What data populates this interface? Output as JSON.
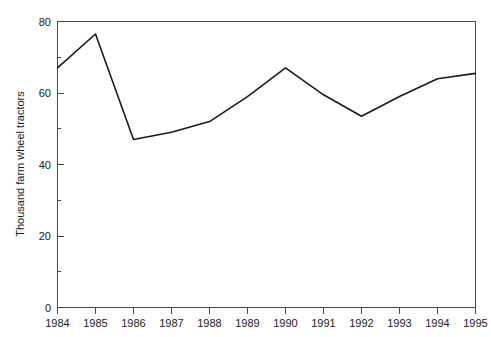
{
  "chart_data": {
    "type": "line",
    "title": "",
    "subtitle": "",
    "xlabel": "",
    "ylabel": "Thousand farm wheel tractors",
    "categories": [
      "1984",
      "1985",
      "1986",
      "1987",
      "1988",
      "1989",
      "1990",
      "1991",
      "1992",
      "1993",
      "1994",
      "1995"
    ],
    "x": [
      1984,
      1985,
      1986,
      1987,
      1988,
      1989,
      1990,
      1991,
      1992,
      1993,
      1994,
      1995
    ],
    "values": [
      67,
      76.5,
      47,
      49,
      52,
      59,
      67,
      59.5,
      53.5,
      59,
      64,
      65.5
    ],
    "series": [
      {
        "name": "Thousand farm wheel tractors",
        "values": [
          67,
          76.5,
          47,
          49,
          52,
          59,
          67,
          59.5,
          53.5,
          59,
          64,
          65.5
        ]
      }
    ],
    "ylim": [
      0,
      80
    ],
    "yticks": [
      0,
      20,
      40,
      60,
      80
    ],
    "ytick_labels": [
      "0",
      "20",
      "40",
      "60",
      "80"
    ],
    "yminor_ticks": [
      10,
      30,
      50,
      70
    ],
    "xticks": [
      1984,
      1985,
      1986,
      1987,
      1988,
      1989,
      1990,
      1991,
      1992,
      1993,
      1994,
      1995
    ],
    "xtick_labels": [
      "1984",
      "1985",
      "1986",
      "1987",
      "1988",
      "1989",
      "1990",
      "1991",
      "1992",
      "1993",
      "1994",
      "1995"
    ],
    "grid": false,
    "legend": false,
    "legend_position": "none",
    "line_color": "#1a1a1a",
    "axis_color": "#4a4a4a",
    "background_color": "#ffffff"
  }
}
